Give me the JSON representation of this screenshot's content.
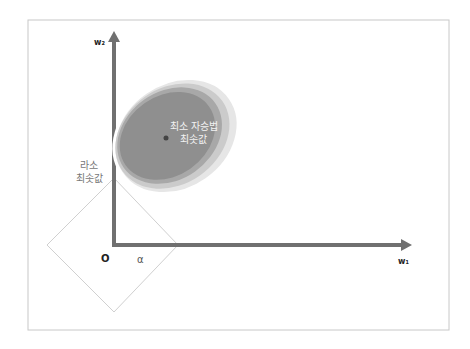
{
  "diagram": {
    "axes": {
      "y_label": "w₂",
      "x_label": "w₁",
      "origin_label": "O",
      "alpha_label": "α"
    },
    "ellipse": {
      "label_line1": "최소 자승법",
      "label_line2": "최솟값",
      "colors": [
        "#e4e4e4",
        "#c8c8c8",
        "#a6a6a6",
        "#8e8e8e"
      ]
    },
    "lasso": {
      "label_line1": "라소",
      "label_line2": "최솟값"
    },
    "colors": {
      "axis": "#707070",
      "frame": "#c8c8c8",
      "diamond": "#d0d0d0",
      "dot": "#444444"
    }
  }
}
